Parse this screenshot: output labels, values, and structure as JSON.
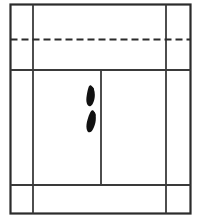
{
  "figure": {
    "name": "badminton-court-diagram",
    "background_color": "#ffffff",
    "line_color": "#2b2b2b",
    "footprint_color": "#111111"
  },
  "court": {
    "outer_boundary": {
      "name": "doubles-sideline-boundary",
      "x": 10.5,
      "y": 4.5,
      "width": 180,
      "height": 209,
      "stroke_width": 2.2
    },
    "lines": [
      {
        "name": "left-singles-sideline",
        "orientation": "vertical",
        "x": 33,
        "y1": 4.5,
        "y2": 213.5,
        "style": "solid",
        "stroke_width": 1.8
      },
      {
        "name": "right-singles-sideline",
        "orientation": "vertical",
        "x": 166,
        "y1": 4.5,
        "y2": 213.5,
        "style": "solid",
        "stroke_width": 1.8
      },
      {
        "name": "net-line",
        "orientation": "horizontal",
        "y": 39.5,
        "x1": 10.5,
        "x2": 190.5,
        "style": "dashed",
        "dash_pattern": "7,4",
        "stroke_width": 2.0
      },
      {
        "name": "short-service-line",
        "orientation": "horizontal",
        "y": 70,
        "x1": 10.5,
        "x2": 190.5,
        "style": "solid",
        "stroke_width": 1.8
      },
      {
        "name": "long-service-line-doubles",
        "orientation": "horizontal",
        "y": 185,
        "x1": 10.5,
        "x2": 190.5,
        "style": "solid",
        "stroke_width": 1.8
      },
      {
        "name": "centre-line",
        "orientation": "vertical",
        "x": 101,
        "y1": 70,
        "y2": 185,
        "style": "solid",
        "stroke_width": 1.8
      }
    ]
  },
  "footprints": [
    {
      "name": "footprint-front-left-foot",
      "cx": 90,
      "cy": 96,
      "rotation": -14,
      "scale": 1.0
    },
    {
      "name": "footprint-rear-right-foot",
      "cx": 91,
      "cy": 121,
      "rotation": -8,
      "scale": 1.0
    }
  ]
}
